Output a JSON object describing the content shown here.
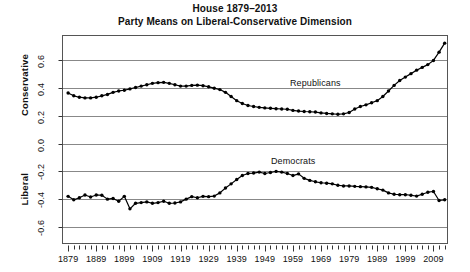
{
  "figure": {
    "title_line1": "House 1879–2013",
    "title_line2": "Party Means on Liberal-Conservative Dimension",
    "axis_left_top": "Conservative",
    "axis_left_bottom": "Liberal",
    "plot_frame_color": "#555555",
    "gridline_color": "#888888",
    "series_color": "#000000",
    "background": "#ffffff"
  },
  "chart_data": {
    "type": "line",
    "title": "House 1879–2013\nParty Means on Liberal-Conservative Dimension",
    "xlabel": "",
    "ylabel": "Liberal – Conservative",
    "xlim": [
      1877,
      2014
    ],
    "ylim": [
      -0.72,
      0.78
    ],
    "yticks": [
      0.6,
      0.4,
      0.2,
      0.0,
      -0.2,
      -0.4,
      -0.6
    ],
    "ytick_labels": [
      "0.6",
      "0.4",
      "0.2",
      "0.0",
      "-0.2",
      "-0.4",
      "-0.6"
    ],
    "xticks": [
      1879,
      1889,
      1899,
      1909,
      1919,
      1929,
      1939,
      1949,
      1959,
      1969,
      1979,
      1989,
      1999,
      2009
    ],
    "xtick_labels": [
      "1879",
      "1889",
      "1899",
      "1909",
      "1919",
      "1929",
      "1939",
      "1949",
      "1959",
      "1969",
      "1979",
      "1989",
      "1999",
      "2009"
    ],
    "minor_tick_interval": 2,
    "grid": true,
    "grid_axis": "y",
    "legend": "inline-annotations",
    "annotations": [
      {
        "text": "Republicans",
        "x": 1967,
        "y": 0.29
      },
      {
        "text": "Democrats",
        "x": 1949,
        "y": -0.12
      }
    ],
    "x": [
      1879,
      1881,
      1883,
      1885,
      1887,
      1889,
      1891,
      1893,
      1895,
      1897,
      1899,
      1901,
      1903,
      1905,
      1907,
      1909,
      1911,
      1913,
      1915,
      1917,
      1919,
      1921,
      1923,
      1925,
      1927,
      1929,
      1931,
      1933,
      1935,
      1937,
      1939,
      1941,
      1943,
      1945,
      1947,
      1949,
      1951,
      1953,
      1955,
      1957,
      1959,
      1961,
      1963,
      1965,
      1967,
      1969,
      1971,
      1973,
      1975,
      1977,
      1979,
      1981,
      1983,
      1985,
      1987,
      1989,
      1991,
      1993,
      1995,
      1997,
      1999,
      2001,
      2003,
      2005,
      2007,
      2009,
      2011,
      2013
    ],
    "series": [
      {
        "name": "Republicans",
        "marker": "filled-circle",
        "values": [
          0.365,
          0.345,
          0.335,
          0.33,
          0.33,
          0.335,
          0.345,
          0.355,
          0.37,
          0.38,
          0.385,
          0.395,
          0.405,
          0.415,
          0.425,
          0.435,
          0.44,
          0.442,
          0.435,
          0.425,
          0.415,
          0.415,
          0.42,
          0.422,
          0.418,
          0.41,
          0.4,
          0.39,
          0.37,
          0.34,
          0.31,
          0.29,
          0.275,
          0.268,
          0.262,
          0.258,
          0.255,
          0.252,
          0.25,
          0.248,
          0.24,
          0.235,
          0.232,
          0.23,
          0.228,
          0.222,
          0.218,
          0.215,
          0.212,
          0.215,
          0.225,
          0.25,
          0.268,
          0.28,
          0.295,
          0.31,
          0.34,
          0.38,
          0.42,
          0.455,
          0.48,
          0.505,
          0.53,
          0.55,
          0.57,
          0.6,
          0.66,
          0.725
        ]
      },
      {
        "name": "Democrats",
        "marker": "filled-circle",
        "values": [
          -0.38,
          -0.405,
          -0.39,
          -0.37,
          -0.385,
          -0.37,
          -0.372,
          -0.4,
          -0.395,
          -0.415,
          -0.38,
          -0.47,
          -0.43,
          -0.425,
          -0.42,
          -0.43,
          -0.425,
          -0.415,
          -0.43,
          -0.428,
          -0.42,
          -0.4,
          -0.382,
          -0.39,
          -0.38,
          -0.382,
          -0.378,
          -0.355,
          -0.32,
          -0.29,
          -0.258,
          -0.23,
          -0.215,
          -0.212,
          -0.205,
          -0.215,
          -0.208,
          -0.2,
          -0.205,
          -0.215,
          -0.23,
          -0.218,
          -0.25,
          -0.265,
          -0.275,
          -0.282,
          -0.285,
          -0.29,
          -0.3,
          -0.305,
          -0.305,
          -0.308,
          -0.31,
          -0.312,
          -0.315,
          -0.325,
          -0.335,
          -0.355,
          -0.365,
          -0.368,
          -0.368,
          -0.372,
          -0.378,
          -0.365,
          -0.35,
          -0.345,
          -0.41,
          -0.405
        ]
      }
    ]
  }
}
